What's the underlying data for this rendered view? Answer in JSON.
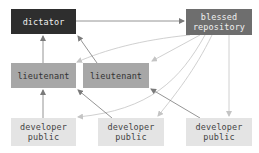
{
  "diagram": {
    "type": "workflow",
    "nodes": {
      "dictator": {
        "lines": [
          "dictator"
        ],
        "color": "#2e2e2e"
      },
      "blessed_repository": {
        "lines": [
          "blessed",
          "repository"
        ],
        "color": "#6e6e6e"
      },
      "lieutenant_1": {
        "lines": [
          "lieutenant"
        ],
        "color": "#a7a7a7"
      },
      "lieutenant_2": {
        "lines": [
          "lieutenant"
        ],
        "color": "#a7a7a7"
      },
      "developer_public_1": {
        "lines": [
          "developer",
          "public"
        ],
        "color": "#e4e4e4"
      },
      "developer_public_2": {
        "lines": [
          "developer",
          "public"
        ],
        "color": "#e4e4e4"
      },
      "developer_public_3": {
        "lines": [
          "developer",
          "public"
        ],
        "color": "#e4e4e4"
      }
    },
    "edges": [
      {
        "from": "dictator",
        "to": "blessed_repository",
        "style": "dark"
      },
      {
        "from": "lieutenant_1",
        "to": "dictator",
        "style": "dark"
      },
      {
        "from": "lieutenant_2",
        "to": "dictator",
        "style": "dark"
      },
      {
        "from": "developer_public_1",
        "to": "lieutenant_1",
        "style": "dark"
      },
      {
        "from": "developer_public_2",
        "to": "lieutenant_2",
        "style": "dark"
      },
      {
        "from": "developer_public_3",
        "to": "lieutenant_2",
        "style": "dark"
      },
      {
        "from": "blessed_repository",
        "to": "lieutenant_1",
        "style": "light"
      },
      {
        "from": "blessed_repository",
        "to": "lieutenant_2",
        "style": "light"
      },
      {
        "from": "blessed_repository",
        "to": "developer_public_1",
        "style": "light"
      },
      {
        "from": "blessed_repository",
        "to": "developer_public_2",
        "style": "light"
      },
      {
        "from": "blessed_repository",
        "to": "developer_public_3",
        "style": "light"
      }
    ],
    "edge_colors": {
      "dark": "#7a7a7a",
      "light": "#c4c4c4"
    }
  }
}
